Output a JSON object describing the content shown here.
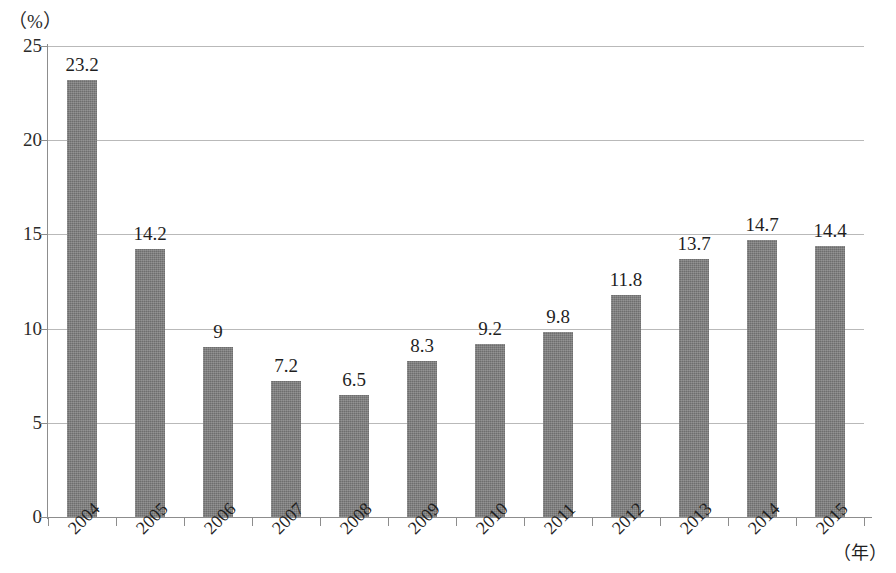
{
  "chart_data": {
    "type": "bar",
    "title": "",
    "subtitle": "",
    "xlabel": "（年）",
    "ylabel": "（%）",
    "categories": [
      "2004",
      "2005",
      "2006",
      "2007",
      "2008",
      "2009",
      "2010",
      "2011",
      "2012",
      "2013",
      "2014",
      "2015"
    ],
    "values": [
      23.2,
      14.2,
      9,
      7.2,
      6.5,
      8.3,
      9.2,
      9.8,
      11.8,
      13.7,
      14.7,
      14.4
    ],
    "value_labels": [
      "23.2",
      "14.2",
      "9",
      "7.2",
      "6.5",
      "8.3",
      "9.2",
      "9.8",
      "11.8",
      "13.7",
      "14.7",
      "14.4"
    ],
    "ylim": [
      0,
      25
    ],
    "ytick_values": [
      0,
      5,
      10,
      15,
      20,
      25
    ],
    "ytick_labels": [
      "0",
      "5",
      "10",
      "15",
      "20",
      "25"
    ],
    "grid": true,
    "grid_axis": "y",
    "legend": null,
    "legend_position": "none",
    "bar_color": "#7b7b7b",
    "gridline_color": "#b9b9b9",
    "axis_color": "#8d8d8d",
    "text_color": "#1f1f1f"
  }
}
